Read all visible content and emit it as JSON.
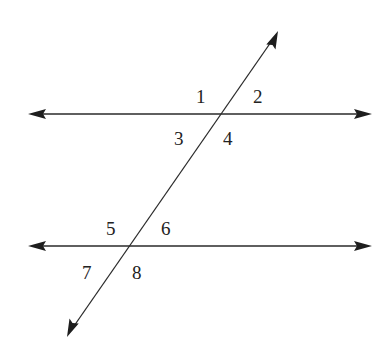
{
  "diagram": {
    "type": "parallel-lines-cut-by-transversal",
    "colors": {
      "stroke": "#2a2a2a",
      "arrow": "#1e1e1e",
      "text": "#222222",
      "background": "#ffffff"
    },
    "lines": [
      {
        "id": "upper-parallel-line",
        "kind": "horizontal"
      },
      {
        "id": "lower-parallel-line",
        "kind": "horizontal"
      },
      {
        "id": "transversal",
        "kind": "slanted"
      }
    ],
    "angle_labels": [
      {
        "text": "1",
        "intersection": "upper",
        "position": "above-left"
      },
      {
        "text": "2",
        "intersection": "upper",
        "position": "above-right"
      },
      {
        "text": "3",
        "intersection": "upper",
        "position": "below-left"
      },
      {
        "text": "4",
        "intersection": "upper",
        "position": "below-right"
      },
      {
        "text": "5",
        "intersection": "lower",
        "position": "above-left"
      },
      {
        "text": "6",
        "intersection": "lower",
        "position": "above-right"
      },
      {
        "text": "7",
        "intersection": "lower",
        "position": "below-left"
      },
      {
        "text": "8",
        "intersection": "lower",
        "position": "below-right"
      }
    ]
  }
}
